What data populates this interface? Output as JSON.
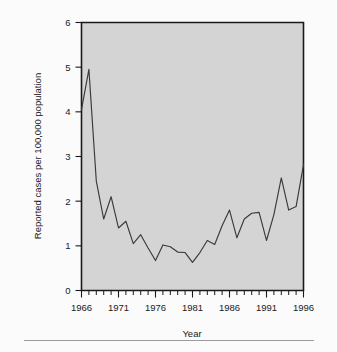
{
  "figure": {
    "background_color": "#fbfbfb",
    "plot_background_color": "#d4d4d4",
    "line_color": "#3a3a3a",
    "axis_color": "#1a1a1a"
  },
  "axes": {
    "x_title": "Year",
    "y_title": "Reported cases per 100,000 population",
    "x_tick_labels": [
      "1966",
      "1971",
      "1976",
      "1981",
      "1986",
      "1991",
      "1996"
    ],
    "y_tick_labels": [
      "0",
      "1",
      "2",
      "3",
      "4",
      "5",
      "6"
    ]
  },
  "chart_data": {
    "type": "line",
    "title": "",
    "xlabel": "Year",
    "ylabel": "Reported cases per 100,000 population",
    "xlim": [
      1966,
      1996
    ],
    "ylim": [
      0,
      6
    ],
    "xticks": [
      1966,
      1971,
      1976,
      1981,
      1986,
      1991,
      1996
    ],
    "yticks": [
      0,
      1,
      2,
      3,
      4,
      5,
      6
    ],
    "x_minor_tick_interval": 1,
    "grid": false,
    "legend": null,
    "x": [
      1966,
      1967,
      1968,
      1969,
      1970,
      1971,
      1972,
      1973,
      1974,
      1975,
      1976,
      1977,
      1978,
      1979,
      1980,
      1981,
      1982,
      1983,
      1984,
      1985,
      1986,
      1987,
      1988,
      1989,
      1990,
      1991,
      1992,
      1993,
      1994,
      1995,
      1996
    ],
    "values": [
      4.05,
      4.95,
      2.45,
      1.6,
      2.1,
      1.4,
      1.55,
      1.05,
      1.25,
      0.95,
      0.67,
      1.02,
      0.98,
      0.86,
      0.85,
      0.63,
      0.85,
      1.12,
      1.03,
      1.45,
      1.8,
      1.18,
      1.6,
      1.73,
      1.75,
      1.12,
      1.7,
      2.52,
      1.8,
      1.88,
      2.82
    ],
    "series": [
      {
        "name": "Reported cases per 100,000 population",
        "values": [
          4.05,
          4.95,
          2.45,
          1.6,
          2.1,
          1.4,
          1.55,
          1.05,
          1.25,
          0.95,
          0.67,
          1.02,
          0.98,
          0.86,
          0.85,
          0.63,
          0.85,
          1.12,
          1.03,
          1.45,
          1.8,
          1.18,
          1.6,
          1.73,
          1.75,
          1.12,
          1.7,
          2.52,
          1.8,
          1.88,
          2.82
        ]
      }
    ]
  }
}
